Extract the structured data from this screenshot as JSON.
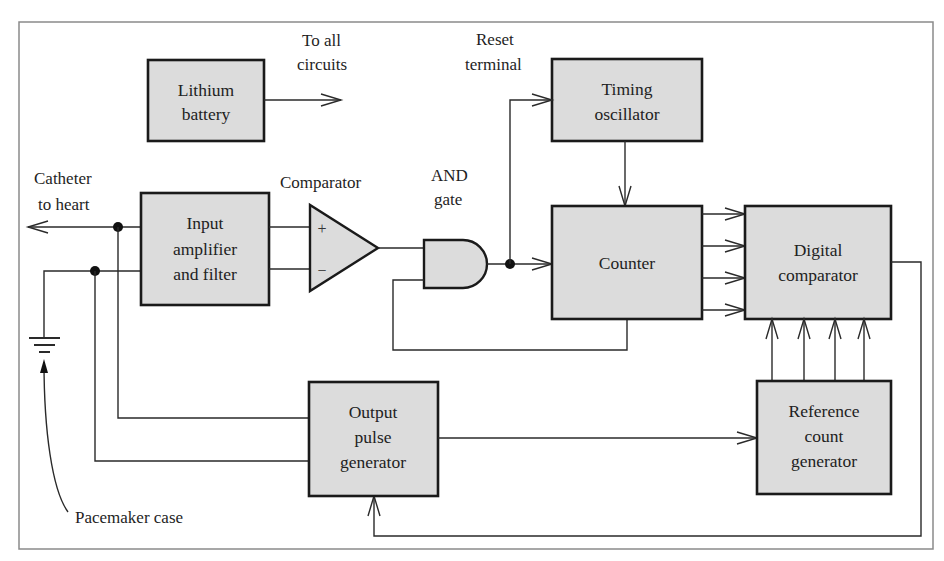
{
  "diagram": {
    "colors": {
      "box_fill": "#dcdcdc",
      "box_stroke": "#1a1a1a",
      "wire": "#2a2a2a",
      "frame": "#8a8a8a"
    },
    "blocks": {
      "battery": {
        "line1": "Lithium",
        "line2": "battery"
      },
      "input_amp": {
        "line1": "Input",
        "line2": "amplifier",
        "line3": "and filter"
      },
      "timing_osc": {
        "line1": "Timing",
        "line2": "oscillator"
      },
      "counter": {
        "line1": "Counter"
      },
      "digital_comp": {
        "line1": "Digital",
        "line2": "comparator"
      },
      "output_pulse": {
        "line1": "Output",
        "line2": "pulse",
        "line3": "generator"
      },
      "ref_count": {
        "line1": "Reference",
        "line2": "count",
        "line3": "generator"
      }
    },
    "components": {
      "comparator": {
        "label": "Comparator",
        "plus": "+",
        "minus": "−"
      },
      "and_gate": {
        "line1": "AND",
        "line2": "gate"
      },
      "ground": {
        "symbol": "ground-icon"
      }
    },
    "labels": {
      "to_all_circuits": {
        "line1": "To all",
        "line2": "circuits"
      },
      "reset_terminal": {
        "line1": "Reset",
        "line2": "terminal"
      },
      "catheter": {
        "line1": "Catheter",
        "line2": "to heart"
      },
      "pacemaker_case": "Pacemaker case"
    },
    "connections": [
      {
        "from": "battery",
        "to": "all circuits"
      },
      {
        "from": "input_amp",
        "to": "catheter"
      },
      {
        "from": "input_amp",
        "to": "comparator",
        "ports": [
          "+",
          "-"
        ]
      },
      {
        "from": "comparator",
        "to": "and_gate"
      },
      {
        "from": "and_gate",
        "to": "counter"
      },
      {
        "from": "and_gate",
        "to": "timing_osc",
        "via": "reset terminal"
      },
      {
        "from": "timing_osc",
        "to": "counter"
      },
      {
        "from": "counter",
        "to": "digital_comp",
        "count": 4
      },
      {
        "from": "counter",
        "to": "and_gate",
        "type": "feedback"
      },
      {
        "from": "ref_count",
        "to": "digital_comp",
        "count": 4
      },
      {
        "from": "output_pulse",
        "to": "ref_count"
      },
      {
        "from": "digital_comp",
        "to": "output_pulse",
        "type": "feedback"
      },
      {
        "from": "output_pulse",
        "to": "catheter"
      },
      {
        "from": "output_pulse",
        "to": "ground"
      }
    ]
  }
}
